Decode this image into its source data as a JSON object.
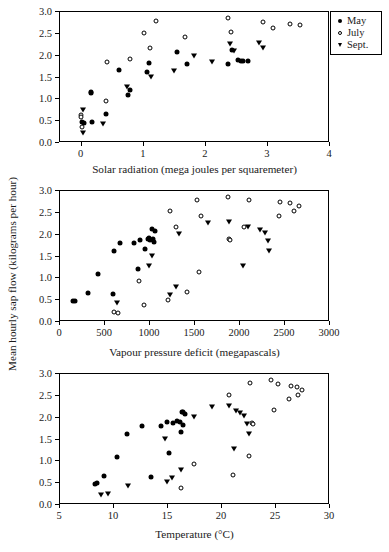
{
  "figure": {
    "ylabel": "Mean hourly sap flow (kilograms per hour)",
    "legend": {
      "items": [
        {
          "label": "May",
          "marker": "filled-circle-icon"
        },
        {
          "label": "July",
          "marker": "open-circle-icon"
        },
        {
          "label": "Sept.",
          "marker": "filled-triangle-down-icon"
        }
      ]
    }
  },
  "chart_data": [
    {
      "type": "scatter",
      "title": "",
      "xlabel": "Solar radiation (mega joules per squaremeter)",
      "ylabel": "Mean hourly sap flow (kilograms per hour)",
      "xlim": [
        -0.35,
        4.0
      ],
      "ylim": [
        0.0,
        3.0
      ],
      "xticks": [
        0,
        1,
        2,
        3,
        4
      ],
      "xticklabels": [
        "0",
        "1",
        "2",
        "3",
        "4"
      ],
      "yticks": [
        0.0,
        0.5,
        1.0,
        1.5,
        2.0,
        2.5,
        3.0
      ],
      "yticklabels": [
        "0.0",
        "0.5",
        "1.0",
        "1.5",
        "2.0",
        "2.5",
        "3.0"
      ],
      "grid": false,
      "legend_position": "outside-top-right",
      "series": [
        {
          "name": "May",
          "marker": "filled-circle",
          "points": [
            [
              0.02,
              0.46
            ],
            [
              0.05,
              0.44
            ],
            [
              0.16,
              1.15
            ],
            [
              0.17,
              1.12
            ],
            [
              0.18,
              0.46
            ],
            [
              0.4,
              0.63
            ],
            [
              0.62,
              1.65
            ],
            [
              0.76,
              1.08
            ],
            [
              1.06,
              1.61
            ],
            [
              1.1,
              1.8
            ],
            [
              1.55,
              2.06
            ],
            [
              1.72,
              1.79
            ],
            [
              2.38,
              1.79
            ],
            [
              2.44,
              2.1
            ],
            [
              2.53,
              1.88
            ],
            [
              2.58,
              1.86
            ],
            [
              2.62,
              1.85
            ],
            [
              2.7,
              1.86
            ],
            [
              0.8,
              1.18
            ]
          ]
        },
        {
          "name": "July",
          "marker": "open-circle",
          "points": [
            [
              0.0,
              0.62
            ],
            [
              0.01,
              0.57
            ],
            [
              0.02,
              0.35
            ],
            [
              0.4,
              0.93
            ],
            [
              0.43,
              1.84
            ],
            [
              0.8,
              1.91
            ],
            [
              1.02,
              2.5
            ],
            [
              1.12,
              2.16
            ],
            [
              1.22,
              2.77
            ],
            [
              1.68,
              2.4
            ],
            [
              2.38,
              2.83
            ],
            [
              2.42,
              2.51
            ],
            [
              2.93,
              2.75
            ],
            [
              3.1,
              2.62
            ],
            [
              3.37,
              2.7
            ],
            [
              3.53,
              2.69
            ]
          ]
        },
        {
          "name": "Sept.",
          "marker": "filled-triangle-down",
          "points": [
            [
              0.03,
              0.72
            ],
            [
              0.04,
              0.18
            ],
            [
              0.36,
              0.38
            ],
            [
              0.74,
              1.23
            ],
            [
              1.14,
              1.47
            ],
            [
              1.5,
              1.6
            ],
            [
              1.82,
              1.95
            ],
            [
              2.12,
              1.82
            ],
            [
              2.4,
              2.21
            ],
            [
              2.47,
              2.07
            ],
            [
              2.87,
              2.24
            ],
            [
              2.94,
              2.12
            ]
          ]
        }
      ]
    },
    {
      "type": "scatter",
      "title": "",
      "xlabel": "Vapour pressure deficit (megapascals)",
      "ylabel": "Mean hourly sap flow (kilograms per hour)",
      "xlim": [
        0,
        3000
      ],
      "ylim": [
        0.0,
        3.0
      ],
      "xticks": [
        0,
        500,
        1000,
        1500,
        2000,
        2500,
        3000
      ],
      "xticklabels": [
        "0",
        "500",
        "1000",
        "1500",
        "2000",
        "2500",
        "3000"
      ],
      "yticks": [
        0.0,
        0.5,
        1.0,
        1.5,
        2.0,
        2.5,
        3.0
      ],
      "yticklabels": [
        "0.0",
        "0.5",
        "1.0",
        "1.5",
        "2.0",
        "2.5",
        "3.0"
      ],
      "grid": false,
      "legend_position": "none",
      "series": [
        {
          "name": "May",
          "marker": "filled-circle",
          "points": [
            [
              150,
              0.46
            ],
            [
              175,
              0.46
            ],
            [
              320,
              0.63
            ],
            [
              430,
              1.08
            ],
            [
              600,
              0.62
            ],
            [
              610,
              1.61
            ],
            [
              680,
              1.79
            ],
            [
              830,
              1.78
            ],
            [
              880,
              1.18
            ],
            [
              900,
              1.86
            ],
            [
              960,
              1.64
            ],
            [
              990,
              1.88
            ],
            [
              1000,
              1.9
            ],
            [
              1010,
              1.86
            ],
            [
              1030,
              2.11
            ],
            [
              1040,
              1.88
            ],
            [
              1060,
              1.8
            ],
            [
              1070,
              2.06
            ]
          ]
        },
        {
          "name": "July",
          "marker": "open-circle",
          "points": [
            [
              610,
              0.2
            ],
            [
              650,
              0.19
            ],
            [
              890,
              0.92
            ],
            [
              940,
              0.36
            ],
            [
              1210,
              0.47
            ],
            [
              1230,
              2.51
            ],
            [
              1300,
              2.16
            ],
            [
              1420,
              0.67
            ],
            [
              1530,
              2.77
            ],
            [
              1560,
              1.12
            ],
            [
              1580,
              2.4
            ],
            [
              1880,
              2.84
            ],
            [
              1890,
              1.88
            ],
            [
              1900,
              1.85
            ],
            [
              2060,
              2.16
            ],
            [
              2110,
              2.76
            ],
            [
              2440,
              2.4
            ],
            [
              2450,
              2.72
            ],
            [
              2570,
              2.7
            ],
            [
              2610,
              2.53
            ],
            [
              2670,
              2.63
            ]
          ]
        },
        {
          "name": "Sept.",
          "marker": "filled-triangle-down",
          "points": [
            [
              640,
              0.38
            ],
            [
              1000,
              1.24
            ],
            [
              1030,
              1.47
            ],
            [
              1230,
              0.57
            ],
            [
              1300,
              0.75
            ],
            [
              1330,
              1.96
            ],
            [
              1660,
              2.21
            ],
            [
              1890,
              2.24
            ],
            [
              2040,
              1.24
            ],
            [
              2100,
              2.13
            ],
            [
              2230,
              2.06
            ],
            [
              2290,
              1.99
            ],
            [
              2320,
              1.81
            ],
            [
              2330,
              1.59
            ]
          ]
        }
      ]
    },
    {
      "type": "scatter",
      "title": "",
      "xlabel": "Temperature (°C)",
      "ylabel": "Mean hourly sap flow (kilograms per hour)",
      "xlim": [
        5,
        30
      ],
      "ylim": [
        0.0,
        3.0
      ],
      "xticks": [
        5,
        10,
        15,
        20,
        25,
        30
      ],
      "xticklabels": [
        "5",
        "10",
        "15",
        "20",
        "25",
        "30"
      ],
      "yticks": [
        0.0,
        0.5,
        1.0,
        1.5,
        2.0,
        2.5,
        3.0
      ],
      "yticklabels": [
        "0.0",
        "0.5",
        "1.0",
        "1.5",
        "2.0",
        "2.5",
        "3.0"
      ],
      "grid": false,
      "legend_position": "none",
      "series": [
        {
          "name": "May",
          "marker": "filled-circle",
          "points": [
            [
              8.3,
              0.46
            ],
            [
              8.5,
              0.47
            ],
            [
              9.2,
              0.63
            ],
            [
              10.4,
              1.08
            ],
            [
              11.3,
              1.61
            ],
            [
              12.7,
              1.79
            ],
            [
              13.5,
              0.62
            ],
            [
              14.4,
              1.79
            ],
            [
              15.0,
              1.87
            ],
            [
              15.2,
              1.17
            ],
            [
              15.6,
              1.86
            ],
            [
              15.9,
              1.9
            ],
            [
              16.2,
              1.88
            ],
            [
              16.3,
              1.64
            ],
            [
              16.4,
              2.11
            ],
            [
              16.5,
              2.1
            ],
            [
              16.5,
              1.8
            ],
            [
              16.7,
              2.06
            ]
          ]
        },
        {
          "name": "July",
          "marker": "open-circle",
          "points": [
            [
              16.3,
              0.36
            ],
            [
              17.5,
              0.92
            ],
            [
              20.7,
              2.49
            ],
            [
              21.1,
              0.66
            ],
            [
              22.6,
              1.11
            ],
            [
              22.7,
              2.77
            ],
            [
              24.6,
              2.83
            ],
            [
              24.9,
              2.16
            ],
            [
              25.3,
              2.75
            ],
            [
              26.3,
              2.4
            ],
            [
              26.5,
              2.7
            ],
            [
              27.0,
              2.68
            ],
            [
              27.1,
              2.5
            ],
            [
              27.5,
              2.62
            ],
            [
              22.9,
              1.86
            ],
            [
              23.0,
              1.83
            ]
          ]
        },
        {
          "name": "Sept.",
          "marker": "filled-triangle-down",
          "points": [
            [
              8.9,
              0.19
            ],
            [
              9.5,
              0.2
            ],
            [
              11.4,
              0.38
            ],
            [
              14.8,
              1.47
            ],
            [
              15.0,
              0.48
            ],
            [
              15.5,
              0.57
            ],
            [
              16.3,
              0.75
            ],
            [
              17.5,
              1.96
            ],
            [
              19.2,
              2.2
            ],
            [
              20.7,
              2.23
            ],
            [
              21.2,
              1.23
            ],
            [
              21.4,
              2.11
            ],
            [
              21.8,
              2.06
            ],
            [
              22.1,
              1.99
            ],
            [
              22.4,
              1.82
            ],
            [
              22.6,
              1.59
            ]
          ]
        }
      ]
    }
  ]
}
